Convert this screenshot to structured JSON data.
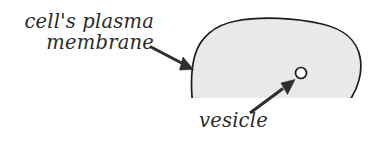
{
  "figure": {
    "background_color": "#ffffff",
    "width": 375,
    "height": 146
  },
  "labels": {
    "membrane": {
      "line1": "cell's plasma",
      "line2": "membrane",
      "full_text": "cell's plasma membrane",
      "color": "#2b2b2b",
      "style": "italic"
    },
    "vesicle": {
      "text": "vesicle",
      "color": "#2b2b2b",
      "style": "italic"
    }
  },
  "shapes": {
    "cell_body": {
      "name": "cell body",
      "fill_color": "#e9e9e9",
      "stroke_color": "#1c1c1c",
      "description": "large rounded dome shape cropped at the bottom edge, extending off the right side"
    },
    "vesicle_circle": {
      "name": "vesicle",
      "fill_color": "#ffffff",
      "stroke_color": "#1c1c1c",
      "center_x": 301,
      "center_y": 73,
      "radius": 5.5
    }
  },
  "arrows": {
    "membrane_arrow": {
      "name": "membrane pointer arrow",
      "color": "#2e2e2e",
      "from_x": 150,
      "from_y": 47,
      "to_x": 193,
      "to_y": 69
    },
    "vesicle_arrow": {
      "name": "vesicle pointer arrow",
      "color": "#2e2e2e",
      "from_x": 250,
      "from_y": 113,
      "to_x": 295,
      "to_y": 79
    }
  }
}
